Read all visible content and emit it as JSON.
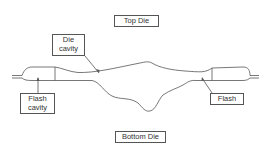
{
  "diagram": {
    "colors": {
      "stroke": "#555555",
      "text": "#333333",
      "background": "#ffffff"
    },
    "labels": {
      "top_die": "Top Die",
      "bottom_die": "Bottom Die",
      "die_cavity": "Die\ncavity",
      "flash_cavity": "Flash\ncavity",
      "flash": "Flash"
    }
  }
}
